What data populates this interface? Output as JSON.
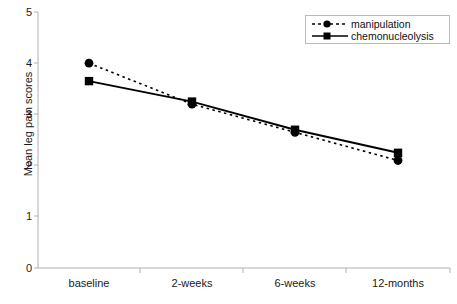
{
  "chart_data": {
    "type": "line",
    "title": "",
    "xlabel": "",
    "ylabel": "Mean leg pain scores",
    "categories": [
      "baseline",
      "2-weeks",
      "6-weeks",
      "12-months"
    ],
    "ylim": [
      0,
      5
    ],
    "yticks": [
      "0",
      "1",
      "2",
      "3",
      "4",
      "5"
    ],
    "grid": false,
    "legend_position": "top-right",
    "series": [
      {
        "name": "manipulation",
        "values": [
          4.0,
          3.2,
          2.65,
          2.1
        ],
        "line_style": "dotted",
        "marker": "circle",
        "color": "#000000"
      },
      {
        "name": "chemonucleolysis",
        "values": [
          3.65,
          3.25,
          2.7,
          2.25
        ],
        "line_style": "solid",
        "marker": "square",
        "color": "#000000"
      }
    ]
  },
  "axes": {
    "y_axis_label": "Mean leg pain scores",
    "y_tick_0": "0",
    "y_tick_1": "1",
    "y_tick_2": "2",
    "y_tick_3": "3",
    "y_tick_4": "4",
    "y_tick_5": "5",
    "x_tick_0": "baseline",
    "x_tick_1": "2-weeks",
    "x_tick_2": "6-weeks",
    "x_tick_3": "12-months"
  },
  "legend": {
    "item_0_label": "manipulation",
    "item_1_label": "chemonucleolysis"
  },
  "colors": {
    "series": "#000000",
    "axis": "#b0b0b0",
    "text": "#1a1a1a",
    "legend_border": "#b9b9b9",
    "background": "#ffffff"
  }
}
